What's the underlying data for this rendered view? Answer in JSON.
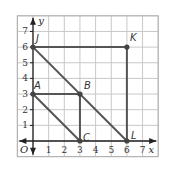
{
  "diagram": {
    "x_axis_label": "x",
    "y_axis_label": "y",
    "origin_label": "O",
    "x_ticks": [
      "1",
      "2",
      "3",
      "4",
      "5",
      "6",
      "7"
    ],
    "y_ticks": [
      "1",
      "2",
      "3",
      "4",
      "5",
      "6",
      "7"
    ],
    "grid_range": {
      "x": [
        -1,
        8
      ],
      "y": [
        -1,
        8
      ]
    },
    "points": [
      {
        "label": "J",
        "x": 0,
        "y": 6
      },
      {
        "label": "K",
        "x": 6,
        "y": 6
      },
      {
        "label": "A",
        "x": 0,
        "y": 3
      },
      {
        "label": "B",
        "x": 3,
        "y": 3
      },
      {
        "label": "C",
        "x": 3,
        "y": 0
      },
      {
        "label": "L",
        "x": 6,
        "y": 0
      }
    ],
    "segments": [
      [
        "J",
        "K"
      ],
      [
        "K",
        "L"
      ],
      [
        "J",
        "L"
      ],
      [
        "A",
        "B"
      ],
      [
        "B",
        "C"
      ],
      [
        "A",
        "C"
      ]
    ],
    "colors": {
      "grid": "#c8c8c8",
      "grid_border": "#b0b0b0",
      "axis": "#222222",
      "segment": "#555555",
      "point": "#444444"
    }
  }
}
